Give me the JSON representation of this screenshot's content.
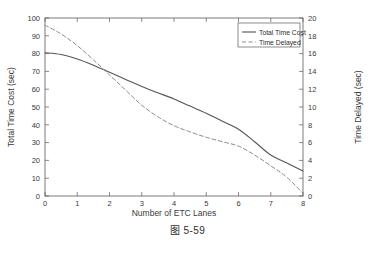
{
  "figure": {
    "caption_cn": "图",
    "caption_num": "5-59",
    "caption_full": "图 5-59"
  },
  "chart_data": {
    "type": "line",
    "title": "",
    "xlabel": "Number of ETC Lanes",
    "ylabel": "Total Time Cost (sec)",
    "ylabel_right": "Time Delayed (sec)",
    "xlim": [
      0,
      8
    ],
    "ylim": [
      0,
      100
    ],
    "ylim_right": [
      0,
      20
    ],
    "xticks": [
      0,
      1,
      2,
      3,
      4,
      5,
      6,
      7,
      8
    ],
    "yticks": [
      0,
      10,
      20,
      30,
      40,
      50,
      60,
      70,
      80,
      90,
      100
    ],
    "yticks_right": [
      0,
      2,
      4,
      6,
      8,
      10,
      12,
      14,
      16,
      18,
      20
    ],
    "grid": false,
    "legend_position": "top-right",
    "x": [
      0,
      0.5,
      1,
      1.5,
      2,
      2.5,
      3,
      3.5,
      4,
      4.5,
      5,
      5.5,
      6,
      6.5,
      7,
      7.5,
      8
    ],
    "series": [
      {
        "name": "Total Time Cost",
        "axis": "left",
        "style": "solid",
        "color": "#555555",
        "values": [
          80.5,
          79.5,
          77.0,
          73.5,
          69.5,
          65.5,
          61.5,
          58.0,
          54.5,
          50.5,
          46.5,
          42.0,
          37.5,
          30.5,
          23.0,
          18.5,
          14.0
        ]
      },
      {
        "name": "Time Delayed",
        "axis": "right",
        "style": "dashed",
        "color": "#8c8c8c",
        "values": [
          19.2,
          18.2,
          16.9,
          15.3,
          13.6,
          11.9,
          10.2,
          8.9,
          7.9,
          7.2,
          6.6,
          6.1,
          5.6,
          4.6,
          3.4,
          2.1,
          0.3
        ]
      }
    ],
    "legend": [
      {
        "label": "Total Time Cost",
        "style": "solid"
      },
      {
        "label": "Time Delayed",
        "style": "dashed"
      }
    ]
  }
}
